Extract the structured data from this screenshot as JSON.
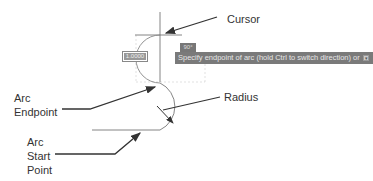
{
  "callouts": {
    "cursor": "Cursor",
    "radius": "Radius",
    "arc_endpoint": [
      "Arc",
      "Endpoint"
    ],
    "arc_start_point": [
      "Arc",
      "Start",
      "Point"
    ]
  },
  "dynamic_input": {
    "value": "1.0000",
    "angle": "90°"
  },
  "tooltip": {
    "prompt": "Specify endpoint of arc (hold Ctrl to switch direction) or",
    "options_icon": "down-arrow-icon"
  },
  "colors": {
    "line": "#555555",
    "arrow": "#333333",
    "tooltip_bg": "#7a7a7a",
    "tooltip_text": "#e6e6e6"
  }
}
